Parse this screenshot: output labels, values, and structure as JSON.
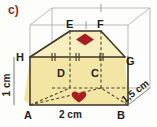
{
  "figure": {
    "part_label": "c)",
    "shape_description": "trapezoidal prism inscribed in a rectangular box",
    "vertices": [
      {
        "id": "E",
        "label": "E"
      },
      {
        "id": "F",
        "label": "F"
      },
      {
        "id": "H",
        "label": "H"
      },
      {
        "id": "G",
        "label": "G"
      },
      {
        "id": "D",
        "label": "D"
      },
      {
        "id": "C",
        "label": "C"
      },
      {
        "id": "A",
        "label": "A"
      },
      {
        "id": "B",
        "label": "B"
      }
    ],
    "dimensions": [
      {
        "id": "height",
        "label": "1 cm",
        "edge": "A-H",
        "orientation": "vertical"
      },
      {
        "id": "width",
        "label": "2 cm",
        "edge": "A-B",
        "orientation": "horizontal"
      },
      {
        "id": "depth",
        "label": "1,5 cm",
        "edge": "B-C",
        "orientation": "diagonal"
      }
    ],
    "markers": [
      {
        "id": "top-diamond",
        "name": "diamond-marker",
        "face": "top"
      },
      {
        "id": "front-heart",
        "name": "heart-marker",
        "face": "front"
      }
    ],
    "colors": {
      "face_fill": "#f3e6a4",
      "face_fill_light": "#f7eec0",
      "outline": "#3c3529",
      "hidden_edge": "#4a4033",
      "box_edge": "#a9a9a9",
      "marker": "#a81d22",
      "label_text": "#231f20",
      "part_label": "#8a2f22",
      "background": "#fdfdfb"
    },
    "tick_marks": {
      "top_edge_ticks": 2,
      "bottom_front_ticks": 2,
      "count_note": "congruence hash marks on parallel edges"
    }
  }
}
